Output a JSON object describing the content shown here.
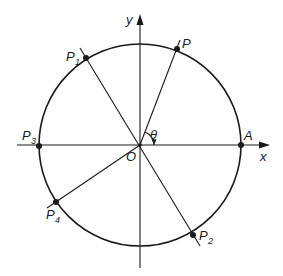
{
  "diagram": {
    "colors": {
      "stroke": "#1a1a1a",
      "background": "#ffffff"
    },
    "axes": {
      "x_label": "x",
      "y_label": "y",
      "origin_label": "O"
    },
    "angle_label": "θ",
    "points": [
      {
        "id": "A",
        "label": "A",
        "sub": "",
        "x": 241,
        "y": 145
      },
      {
        "id": "P",
        "label": "P",
        "sub": "",
        "x": 177,
        "y": 49
      },
      {
        "id": "P1",
        "label": "P",
        "sub": "1",
        "x": 86,
        "y": 58
      },
      {
        "id": "P3",
        "label": "P",
        "sub": "3",
        "x": 39,
        "y": 146
      },
      {
        "id": "P4",
        "label": "P",
        "sub": "4",
        "x": 56,
        "y": 202
      },
      {
        "id": "P2",
        "label": "P",
        "sub": "2",
        "x": 193,
        "y": 235
      }
    ]
  }
}
